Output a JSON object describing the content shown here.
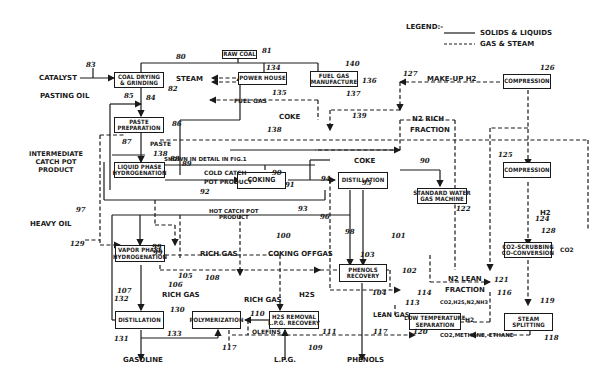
{
  "legend": {
    "title": "LEGEND:-",
    "solid": "SOLIDS & LIQUIDS",
    "dashed": "GAS & STEAM"
  },
  "units": {
    "raw_coal": [
      "RAW COAL"
    ],
    "coal_drying": [
      "COAL DRYING",
      "& GRINDING"
    ],
    "power_house": [
      "POWER HOUSE"
    ],
    "fuel_gas_mfg": [
      "FUEL GAS",
      "MANUFACTURE"
    ],
    "compression_top": [
      "COMPRESSION"
    ],
    "paste_prep": [
      "PASTE",
      "PREPARATION"
    ],
    "liquid_phase": [
      "LIQUID PHASE",
      "HYDROGENATION"
    ],
    "coking": [
      "COKING"
    ],
    "distillation_mid": [
      "DISTILLATION"
    ],
    "water_gas": [
      "STANDARD WATER",
      "GAS MACHINE"
    ],
    "compression_mid": [
      "COMPRESSION"
    ],
    "co2_scrubbing": [
      "CO2-SCRUBBING",
      "CO-CONVERSION"
    ],
    "vapor_phase": [
      "VAPOR PHASE",
      "HYDROGENATION"
    ],
    "phenols_recovery": [
      "PHENOLS",
      "RECOVERY"
    ],
    "distillation_bot": [
      "DISTILLATION"
    ],
    "polymerization": [
      "POLYMERIZATION"
    ],
    "h2s_removal": [
      "H2S REMOVAL",
      "L.P.G. RECOVERY"
    ],
    "low_temp_sep": [
      "LOW TEMPERATURE",
      "SEPARATION"
    ],
    "steam_splitting": [
      "STEAM",
      "SPLITTING"
    ]
  },
  "labels": {
    "catalyst": "CATALYST",
    "pasting_oil": "PASTING OIL",
    "steam": "STEAM",
    "fuel_gas": "FUEL GAS",
    "coke_top": "COKE",
    "make_up_h2": "MAKE-UP H2",
    "n2_rich": "N2 RICH",
    "fraction_rich": "FRACTION",
    "paste": "PASTE",
    "intermediate": [
      "INTERMEDIATE",
      "CATCH POT",
      "PRODUCT"
    ],
    "shown_in_detail": "SHOWN IN DETAIL IN FIG.1",
    "cold_catch": "COLD CATCH",
    "pot_product": "POT PRODUCT",
    "coke_mid": "COKE",
    "hot_catch": [
      "HOT CATCH POT",
      "PRODUCT"
    ],
    "heavy_oil": "HEAVY OIL",
    "h2": "H2",
    "co2_out": "CO2",
    "rich_gas_1": "RICH GAS",
    "coking_offgas": "COKING OFFGAS",
    "rich_gas_2": "RICH GAS",
    "rich_gas_3": "RICH GAS",
    "h2s": "H2S",
    "n2_lean": "N2 LEAN",
    "fraction_lean": "FRACTION",
    "lean_gas": "LEAN GAS",
    "gases": "CO2,H2S,N2,NH3",
    "h2_out": "H2",
    "olefins": "OLEFINS",
    "co2_methane": "CO2,METHANE, ETHANE",
    "gasoline": "GASOLINE",
    "lpg": "L.P.G.",
    "phenols": "PHENOLS"
  },
  "ref_numbers": {
    "n80": "80",
    "n81": "81",
    "n82": "82",
    "n83": "83",
    "n84": "84",
    "n85": "85",
    "n86": "86",
    "n87": "87",
    "n88": "88",
    "n89": "89",
    "n90a": "90",
    "n90b": "90",
    "n91": "91",
    "n92": "92",
    "n93": "93",
    "n94": "94",
    "n95": "95",
    "n96": "96",
    "n97": "97",
    "n98": "98",
    "n99a": "99",
    "n99b": "99",
    "n100": "100",
    "n101": "101",
    "n102": "102",
    "n103": "103",
    "n104": "104",
    "n105": "105",
    "n106": "106",
    "n107": "107",
    "n108": "108",
    "n109": "109",
    "n110": "110",
    "n111": "111",
    "n113": "113",
    "n114": "114",
    "n116": "116",
    "n117a": "117",
    "n117b": "117",
    "n118": "118",
    "n119": "119",
    "n120": "120",
    "n121": "121",
    "n122": "122",
    "n124": "124",
    "n125": "125",
    "n126": "126",
    "n127": "127",
    "n128": "128",
    "n129": "129",
    "n130": "130",
    "n131": "131",
    "n133": "133",
    "n135": "135",
    "n136": "136",
    "n137": "137",
    "n138": "138",
    "n139": "139",
    "n140": "140",
    "n132": "132",
    "n134": "134",
    "n138b": "138"
  }
}
